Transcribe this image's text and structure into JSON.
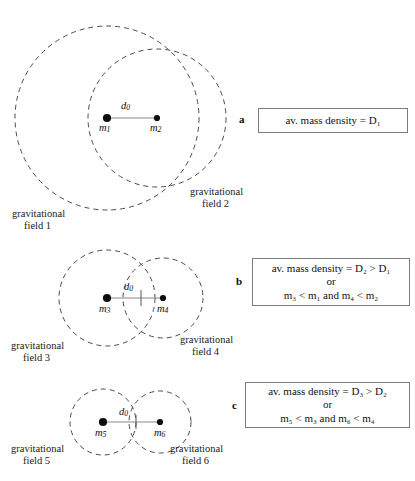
{
  "panels": [
    {
      "letter": "a",
      "masses": [
        {
          "label": "m",
          "index": "1"
        },
        {
          "label": "m",
          "index": "2"
        }
      ],
      "distance_label": "d",
      "distance_index": "0",
      "fields": [
        {
          "line1": "gravitational",
          "line2": "field 1"
        },
        {
          "line1": "gravitational",
          "line2": "field 2"
        }
      ],
      "note_lines": [
        "av. mass density = D₁"
      ]
    },
    {
      "letter": "b",
      "masses": [
        {
          "label": "m",
          "index": "3"
        },
        {
          "label": "m",
          "index": "4"
        }
      ],
      "distance_label": "d",
      "distance_index": "0",
      "fields": [
        {
          "line1": "gravitational",
          "line2": "field 3"
        },
        {
          "line1": "gravitational",
          "line2": "field 4"
        }
      ],
      "note_lines": [
        "av. mass density = D₂ > D₁",
        "or",
        "m₃ < m₁ and m₄ < m₂"
      ]
    },
    {
      "letter": "c",
      "masses": [
        {
          "label": "m",
          "index": "5"
        },
        {
          "label": "m",
          "index": "6"
        }
      ],
      "distance_label": "d",
      "distance_index": "0",
      "fields": [
        {
          "line1": "gravitational",
          "line2": "field 5"
        },
        {
          "line1": "gravitational",
          "line2": "field 6"
        }
      ],
      "note_lines": [
        "av. mass density = D₃ > D₂",
        "or",
        "m₅ < m₃ and m₆ < m₄"
      ]
    }
  ],
  "colors": {
    "stroke": "#4a4a4a",
    "dot": "#0d0d0d",
    "box_border": "#7d7d7d",
    "background": "#ffffff"
  }
}
